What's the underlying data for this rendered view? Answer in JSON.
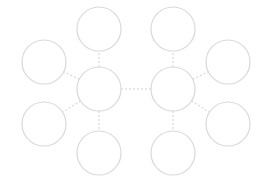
{
  "diagram": {
    "type": "double-bubble-map",
    "width": 262,
    "height": 186,
    "colors": {
      "background": "#ffffff",
      "node_stroke": "#d9d9d9",
      "node_fill": "#ffffff",
      "connector_stroke": "#cfcfcf"
    },
    "node_radius": 22,
    "nodes": [
      {
        "id": "hub-left",
        "role": "hub",
        "cx": 99,
        "cy": 89,
        "label": ""
      },
      {
        "id": "hub-right",
        "role": "hub",
        "cx": 173,
        "cy": 89,
        "label": ""
      },
      {
        "id": "left-top",
        "role": "leaf",
        "cx": 99,
        "cy": 29,
        "label": ""
      },
      {
        "id": "left-upper",
        "role": "leaf",
        "cx": 44,
        "cy": 62,
        "label": ""
      },
      {
        "id": "left-lower",
        "role": "leaf",
        "cx": 44,
        "cy": 124,
        "label": ""
      },
      {
        "id": "left-bottom",
        "role": "leaf",
        "cx": 99,
        "cy": 153,
        "label": ""
      },
      {
        "id": "right-top",
        "role": "leaf",
        "cx": 173,
        "cy": 29,
        "label": ""
      },
      {
        "id": "right-upper",
        "role": "leaf",
        "cx": 228,
        "cy": 62,
        "label": ""
      },
      {
        "id": "right-lower",
        "role": "leaf",
        "cx": 228,
        "cy": 124,
        "label": ""
      },
      {
        "id": "right-bottom",
        "role": "leaf",
        "cx": 173,
        "cy": 153,
        "label": ""
      }
    ],
    "edges": [
      {
        "from": "hub-left",
        "to": "hub-right"
      },
      {
        "from": "hub-left",
        "to": "left-top"
      },
      {
        "from": "hub-left",
        "to": "left-upper"
      },
      {
        "from": "hub-left",
        "to": "left-lower"
      },
      {
        "from": "hub-left",
        "to": "left-bottom"
      },
      {
        "from": "hub-right",
        "to": "right-top"
      },
      {
        "from": "hub-right",
        "to": "right-upper"
      },
      {
        "from": "hub-right",
        "to": "right-lower"
      },
      {
        "from": "hub-right",
        "to": "right-bottom"
      }
    ]
  }
}
